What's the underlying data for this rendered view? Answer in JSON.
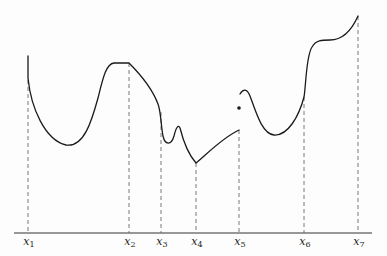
{
  "figure": {
    "axis": {
      "y": 233,
      "x_start": 14,
      "x_end": 372
    },
    "points": [
      {
        "id": "x1",
        "base": "x",
        "sub": "1",
        "x": 28,
        "curve_y": 56
      },
      {
        "id": "x2",
        "base": "x",
        "sub": "2",
        "x": 129,
        "curve_y": 63
      },
      {
        "id": "x3",
        "base": "x",
        "sub": "3",
        "x": 161,
        "curve_y": 112
      },
      {
        "id": "x4",
        "base": "x",
        "sub": "4",
        "x": 196,
        "curve_y": 163
      },
      {
        "id": "x5",
        "base": "x",
        "sub": "5",
        "x": 239,
        "curve_y": 130
      },
      {
        "id": "x6",
        "base": "x",
        "sub": "6",
        "x": 304,
        "curve_y": 97
      },
      {
        "id": "x7",
        "base": "x",
        "sub": "7",
        "x": 358,
        "curve_y": 16
      }
    ],
    "isolated_point": {
      "x": 239,
      "y": 108
    },
    "colors": {
      "curve": "#1a1a1a",
      "axis": "#333333",
      "guide": "#6a6a6a",
      "background": "#fdfdfd"
    }
  },
  "labels": {
    "x1": {
      "base": "x",
      "sub": "1"
    },
    "x2": {
      "base": "x",
      "sub": "2"
    },
    "x3": {
      "base": "x",
      "sub": "3"
    },
    "x4": {
      "base": "x",
      "sub": "4"
    },
    "x5": {
      "base": "x",
      "sub": "5"
    },
    "x6": {
      "base": "x",
      "sub": "6"
    },
    "x7": {
      "base": "x",
      "sub": "7"
    }
  }
}
